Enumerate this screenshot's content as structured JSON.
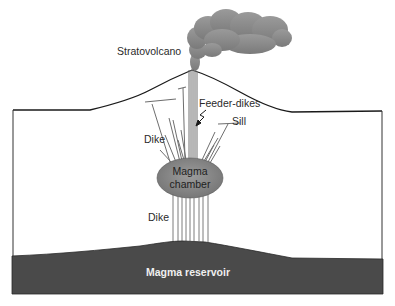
{
  "diagram": {
    "labels": {
      "stratovolcano": "Stratovolcano",
      "feeder_dikes": "Feeder-dikes",
      "sill": "Sill",
      "dike_upper": "Dike",
      "magma_chamber_line1": "Magma",
      "magma_chamber_line2": "chamber",
      "dike_lower": "Dike",
      "magma_reservoir": "Magma reservoir"
    },
    "colors": {
      "background": "#ffffff",
      "outline": "#1a1a1a",
      "reservoir": "#4a4a4a",
      "chamber": "#8a8a8a",
      "dike": "#6e6e6e",
      "smoke": "#8c8c8c"
    }
  }
}
